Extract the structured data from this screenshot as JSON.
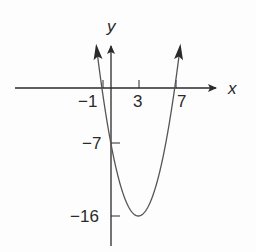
{
  "chart_data": {
    "type": "line",
    "title": "",
    "function": "y = (x + 1)(x - 7) = x^2 - 6x - 7",
    "xlabel": "x",
    "ylabel": "y",
    "x_tick_labels": [
      "-1",
      "3",
      "7"
    ],
    "x_ticks": [
      -1,
      3,
      7
    ],
    "y_tick_labels": [
      "-7",
      "-16"
    ],
    "y_ticks": [
      -7,
      -16
    ],
    "key_points": [
      {
        "label": "x-intercept",
        "x": -1,
        "y": 0
      },
      {
        "label": "x-intercept",
        "x": 7,
        "y": 0
      },
      {
        "label": "y-intercept",
        "x": 0,
        "y": -7
      },
      {
        "label": "vertex",
        "x": 3,
        "y": -16
      }
    ],
    "x": [
      -1.6,
      -1,
      0,
      1,
      2,
      3,
      4,
      5,
      6,
      7,
      7.6
    ],
    "series": [
      {
        "name": "parabola",
        "values": [
          5.16,
          0,
          -7,
          -12,
          -15,
          -16,
          -15,
          -12,
          -7,
          0,
          5.16
        ]
      }
    ],
    "xlim": [
      -10.5,
      12
    ],
    "ylim": [
      -19,
      6
    ],
    "grid": false,
    "legend": "none"
  },
  "labels": {
    "x_axis": "x",
    "y_axis": "y",
    "tick_x_neg1": "−1",
    "tick_x_3": "3",
    "tick_x_7": "7",
    "tick_y_neg7": "−7",
    "tick_y_neg16": "−16"
  },
  "colors": {
    "ink": "#2a2a2a",
    "curve": "#555555",
    "background": "#fdfdfd"
  }
}
